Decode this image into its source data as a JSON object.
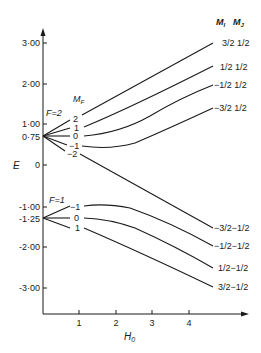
{
  "figure": {
    "type": "Breit-Rabi energy level diagram",
    "y_axis": {
      "label": "E",
      "ticks": [
        {
          "label": "3·00",
          "value": 3.0
        },
        {
          "label": "2·00",
          "value": 2.0
        },
        {
          "label": "1·00",
          "value": 1.0
        },
        {
          "label": "0·75",
          "value": 0.75
        },
        {
          "label": "0",
          "value": 0
        },
        {
          "label": "-1·00",
          "value": -1.0
        },
        {
          "label": "-1·25",
          "value": -1.25
        },
        {
          "label": "-2·00",
          "value": -2.0
        },
        {
          "label": "-3·00",
          "value": -3.0
        }
      ]
    },
    "x_axis": {
      "label": "H",
      "label_sub": "0",
      "ticks": [
        {
          "label": "1",
          "value": 1
        },
        {
          "label": "2",
          "value": 2
        },
        {
          "label": "3",
          "value": 3
        },
        {
          "label": "4",
          "value": 4
        }
      ]
    },
    "header": {
      "mi": "M",
      "mi_sub": "I",
      "mj": "M",
      "mj_sub": "J",
      "mf": "M",
      "mf_sub": "F"
    },
    "f2_group": {
      "label": "F=2",
      "origin_energy": 0.75,
      "mf_labels": [
        "2",
        "1",
        "0",
        "−1",
        "−2"
      ]
    },
    "f1_group": {
      "label": "F=1",
      "origin_energy": -1.25,
      "mf_labels": [
        "−1",
        "0",
        "1"
      ]
    },
    "right_labels_upper": [
      {
        "mi": "3/2",
        "mj": "1/2"
      },
      {
        "mi": "1/2",
        "mj": "1/2"
      },
      {
        "mi": "−1/2",
        "mj": "1/2"
      },
      {
        "mi": "−3/2",
        "mj": "1/2"
      }
    ],
    "right_labels_lower": [
      {
        "mi": "−3/2",
        "mj": "−1/2"
      },
      {
        "mi": "−1/2",
        "mj": "−1/2"
      },
      {
        "mi": "1/2",
        "mj": "−1/2"
      },
      {
        "mi": "3/2",
        "mj": "−1/2"
      }
    ]
  }
}
